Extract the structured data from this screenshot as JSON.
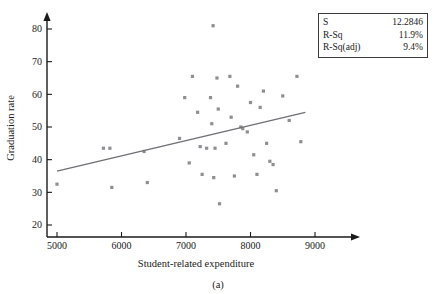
{
  "figure": {
    "caption": "(a)"
  },
  "stats": {
    "rows": [
      {
        "name": "S",
        "value": "12.2846"
      },
      {
        "name": "R-Sq",
        "value": "11.9%"
      },
      {
        "name": "R-Sq(adj)",
        "value": "9.4%"
      }
    ]
  },
  "chart_data": {
    "type": "scatter",
    "title": "",
    "xlabel": "Student-related expenditure",
    "ylabel": "Graduation rate",
    "xlim": [
      4700,
      9350
    ],
    "ylim": [
      16,
      84
    ],
    "xticks": [
      5000,
      6000,
      7000,
      8000,
      9000
    ],
    "xtick_labels": [
      "5000",
      "6000",
      "7000",
      "8000",
      "9000"
    ],
    "yticks": [
      20,
      30,
      40,
      50,
      60,
      70,
      80
    ],
    "ytick_labels": [
      "20",
      "30",
      "40",
      "50",
      "60",
      "70",
      "80"
    ],
    "grid": false,
    "legend": null,
    "marker": "square",
    "marker_color": "#8e8e93",
    "points": [
      {
        "x": 5000,
        "y": 32.5
      },
      {
        "x": 5720,
        "y": 43.5
      },
      {
        "x": 5820,
        "y": 43.5
      },
      {
        "x": 5850,
        "y": 31.5
      },
      {
        "x": 6350,
        "y": 42.5
      },
      {
        "x": 6400,
        "y": 33.0
      },
      {
        "x": 6900,
        "y": 46.5
      },
      {
        "x": 6980,
        "y": 59.0
      },
      {
        "x": 7050,
        "y": 39.0
      },
      {
        "x": 7100,
        "y": 65.5
      },
      {
        "x": 7180,
        "y": 54.5
      },
      {
        "x": 7220,
        "y": 44.0
      },
      {
        "x": 7250,
        "y": 35.5
      },
      {
        "x": 7320,
        "y": 43.5
      },
      {
        "x": 7380,
        "y": 59.0
      },
      {
        "x": 7400,
        "y": 51.0
      },
      {
        "x": 7420,
        "y": 81.0
      },
      {
        "x": 7430,
        "y": 34.5
      },
      {
        "x": 7450,
        "y": 43.5
      },
      {
        "x": 7480,
        "y": 65.0
      },
      {
        "x": 7500,
        "y": 55.5
      },
      {
        "x": 7520,
        "y": 26.5
      },
      {
        "x": 7620,
        "y": 45.0
      },
      {
        "x": 7680,
        "y": 65.5
      },
      {
        "x": 7700,
        "y": 53.0
      },
      {
        "x": 7750,
        "y": 35.0
      },
      {
        "x": 7800,
        "y": 62.5
      },
      {
        "x": 7850,
        "y": 50.0
      },
      {
        "x": 7880,
        "y": 49.5
      },
      {
        "x": 7950,
        "y": 48.5
      },
      {
        "x": 8000,
        "y": 57.5
      },
      {
        "x": 8050,
        "y": 41.5
      },
      {
        "x": 8100,
        "y": 35.5
      },
      {
        "x": 8150,
        "y": 56.0
      },
      {
        "x": 8200,
        "y": 61.0
      },
      {
        "x": 8250,
        "y": 45.0
      },
      {
        "x": 8300,
        "y": 39.5
      },
      {
        "x": 8350,
        "y": 38.5
      },
      {
        "x": 8400,
        "y": 30.5
      },
      {
        "x": 8500,
        "y": 59.5
      },
      {
        "x": 8600,
        "y": 52.0
      },
      {
        "x": 8720,
        "y": 65.5
      },
      {
        "x": 8780,
        "y": 45.5
      }
    ],
    "fit_line": {
      "label": "regression line",
      "x0": 5000,
      "y0": 36.5,
      "x1": 8850,
      "y1": 54.5,
      "color": "#6f6f75"
    }
  }
}
